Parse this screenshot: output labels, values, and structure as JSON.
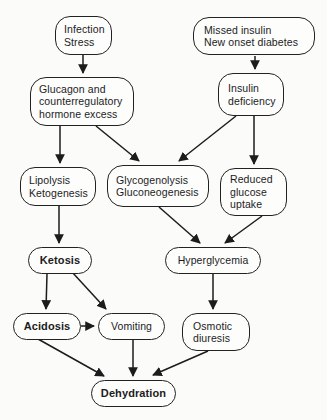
{
  "diagram": {
    "type": "flowchart",
    "colors": {
      "line": "#1c1c1c",
      "text": "#1c1c1c",
      "background": "#fbfbfa"
    },
    "nodes": {
      "infection_stress": {
        "label": "Infection\nStress",
        "bold": false
      },
      "missed_insulin": {
        "label": "Missed insulin\nNew onset diabetes",
        "bold": false
      },
      "glucagon_excess": {
        "label": "Glucagon and\ncounterregulatory\nhormone excess",
        "bold": false
      },
      "insulin_deficiency": {
        "label": "Insulin\ndeficiency",
        "bold": false
      },
      "lipolysis_ketogenesis": {
        "label": "Lipolysis\nKetogenesis",
        "bold": false
      },
      "glycogenolysis_gluconeogenesis": {
        "label": "Glycogenolysis\nGluconeogenesis",
        "bold": false
      },
      "reduced_glucose_uptake": {
        "label": "Reduced\nglucose\nuptake",
        "bold": false
      },
      "ketosis": {
        "label": "Ketosis",
        "bold": true
      },
      "hyperglycemia": {
        "label": "Hyperglycemia",
        "bold": false
      },
      "acidosis": {
        "label": "Acidosis",
        "bold": true
      },
      "vomiting": {
        "label": "Vomiting",
        "bold": false
      },
      "osmotic_diuresis": {
        "label": "Osmotic\ndiuresis",
        "bold": false
      },
      "dehydration": {
        "label": "Dehydration",
        "bold": true
      }
    },
    "edges": [
      {
        "from": "infection_stress",
        "to": "glucagon_excess"
      },
      {
        "from": "missed_insulin",
        "to": "insulin_deficiency"
      },
      {
        "from": "glucagon_excess",
        "to": "lipolysis_ketogenesis"
      },
      {
        "from": "glucagon_excess",
        "to": "glycogenolysis_gluconeogenesis"
      },
      {
        "from": "insulin_deficiency",
        "to": "glycogenolysis_gluconeogenesis"
      },
      {
        "from": "insulin_deficiency",
        "to": "reduced_glucose_uptake"
      },
      {
        "from": "lipolysis_ketogenesis",
        "to": "ketosis"
      },
      {
        "from": "glycogenolysis_gluconeogenesis",
        "to": "hyperglycemia"
      },
      {
        "from": "reduced_glucose_uptake",
        "to": "hyperglycemia"
      },
      {
        "from": "ketosis",
        "to": "acidosis"
      },
      {
        "from": "ketosis",
        "to": "vomiting"
      },
      {
        "from": "acidosis",
        "to": "vomiting"
      },
      {
        "from": "hyperglycemia",
        "to": "osmotic_diuresis"
      },
      {
        "from": "acidosis",
        "to": "dehydration"
      },
      {
        "from": "vomiting",
        "to": "dehydration"
      },
      {
        "from": "osmotic_diuresis",
        "to": "dehydration"
      }
    ]
  }
}
